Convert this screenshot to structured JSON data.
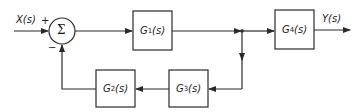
{
  "diagram": {
    "type": "block-diagram",
    "input_label": "X(s)",
    "output_label": "Y(s)",
    "summing_junction": {
      "symbol": "Σ",
      "signs": {
        "input": "+",
        "feedback": "−"
      }
    },
    "blocks": [
      {
        "id": "G1",
        "name": "G",
        "sub": "1",
        "arg": "(s)"
      },
      {
        "id": "G2",
        "name": "G",
        "sub": "2",
        "arg": "(s)"
      },
      {
        "id": "G3",
        "name": "G",
        "sub": "3",
        "arg": "(s)"
      },
      {
        "id": "G4",
        "name": "G",
        "sub": "4",
        "arg": "(s)"
      }
    ],
    "connections": [
      {
        "from": "X(s)",
        "to": "Σ"
      },
      {
        "from": "Σ",
        "to": "G1"
      },
      {
        "from": "G1",
        "to": "pickoff"
      },
      {
        "from": "pickoff",
        "to": "G4"
      },
      {
        "from": "G4",
        "to": "Y(s)"
      },
      {
        "from": "pickoff",
        "to": "G3"
      },
      {
        "from": "G3",
        "to": "G2"
      },
      {
        "from": "G2",
        "to": "Σ",
        "sign": "−"
      }
    ],
    "colors": {
      "stroke": "#2a2a2a",
      "background": "#ffffff"
    }
  }
}
